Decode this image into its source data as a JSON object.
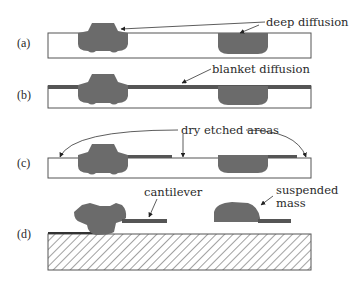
{
  "diagram": {
    "steps": [
      {
        "id": "a",
        "label": "(a)",
        "annotation": "deep diffusion"
      },
      {
        "id": "b",
        "label": "(b)",
        "annotation": "blanket diffusion"
      },
      {
        "id": "c",
        "label": "(c)",
        "annotation": "dry etched areas"
      },
      {
        "id": "d",
        "label": "(d)",
        "annotations": [
          "cantilever",
          "suspended",
          "mass"
        ]
      }
    ],
    "colors": {
      "diffusion_fill": "#6b6b6b",
      "outline": "#555555",
      "substrate_fill": "#ffffff",
      "hatch": "#444444",
      "background": "#ffffff"
    }
  }
}
